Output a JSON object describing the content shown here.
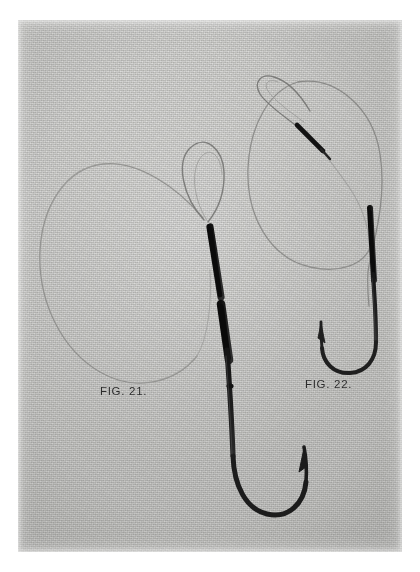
{
  "plate": {
    "medium": "black-and-white photographic print",
    "background_color": "#ffffff",
    "print_color": "#d3d3d1",
    "ink_color": "#1a1a1a"
  },
  "figures": [
    {
      "id": "fig21",
      "caption": "FIG. 21.",
      "subject": "snelled fishing hook with long coiled gut leader and loop",
      "hook_point_direction": "up-right",
      "has_shank_whipping": true,
      "leader_loop": "large single coil"
    },
    {
      "id": "fig22",
      "caption": "FIG. 22.",
      "subject": "snelled fishing hook with gut leader whipped loop end",
      "hook_point_direction": "up-left",
      "has_shank_whipping": true,
      "leader_loop": "oval coil with whipped loop terminal"
    }
  ],
  "captions": {
    "fig21": "FIG. 21.",
    "fig22": "FIG. 22."
  }
}
